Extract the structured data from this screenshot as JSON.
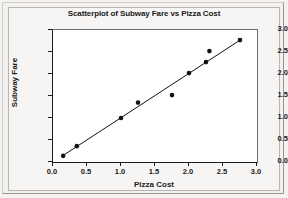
{
  "figure": {
    "title": "Scatterplot of Subway Fare vs Pizza Cost",
    "background_color": "#f2f1ef",
    "plot_background_color": "#ffffff",
    "marker_color": "#111111",
    "line_color": "#111111",
    "text_color": "#1a1a1a"
  },
  "chart_data": {
    "type": "scatter",
    "title": "Scatterplot of Subway Fare vs Pizza Cost",
    "xlabel": "Pizza Cost",
    "ylabel": "Subway Fare",
    "xlim": [
      0.0,
      3.0
    ],
    "ylim": [
      0.0,
      3.0
    ],
    "xticks": [
      0.0,
      0.5,
      1.0,
      1.5,
      2.0,
      2.5,
      3.0
    ],
    "yticks": [
      0.0,
      0.5,
      1.0,
      1.5,
      2.0,
      2.5,
      3.0
    ],
    "xtick_labels": [
      "0.0",
      "0.5",
      "1.0",
      "1.5",
      "2.0",
      "2.5",
      "3.0"
    ],
    "ytick_labels": [
      "0.0",
      "0.5",
      "1.0",
      "1.5",
      "2.0",
      "2.5",
      "3.0"
    ],
    "grid": false,
    "legend": false,
    "series": [
      {
        "name": "Subway Fare vs Pizza Cost",
        "marker": "filled-circle",
        "points": [
          {
            "x": 0.15,
            "y": 0.14
          },
          {
            "x": 0.35,
            "y": 0.36
          },
          {
            "x": 1.0,
            "y": 1.0
          },
          {
            "x": 1.25,
            "y": 1.35
          },
          {
            "x": 1.75,
            "y": 1.52
          },
          {
            "x": 2.0,
            "y": 2.02
          },
          {
            "x": 2.25,
            "y": 2.27
          },
          {
            "x": 2.3,
            "y": 2.52
          },
          {
            "x": 2.75,
            "y": 2.77
          }
        ]
      }
    ],
    "fit_line": {
      "type": "linear-regression",
      "start": {
        "x": 0.13,
        "y": 0.13
      },
      "end": {
        "x": 2.77,
        "y": 2.79
      }
    }
  }
}
